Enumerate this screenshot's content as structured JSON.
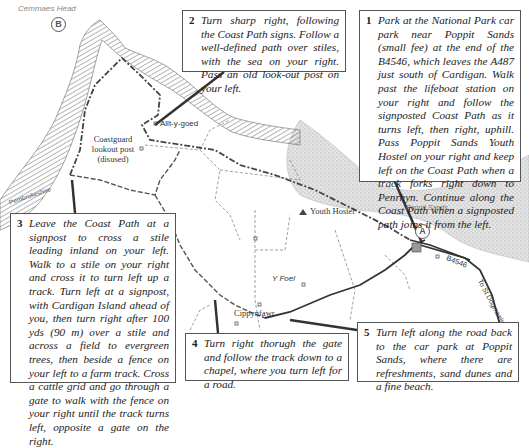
{
  "map": {
    "place_labels": {
      "cemmaes_head": "Cemmaes Head",
      "allt_y_goed": "Allt-y-goed",
      "coastguard": "Coastguard lookout post (disused)",
      "youth_hostel": "Youth Hostel",
      "y_foel": "Y Foel",
      "cippyn_fawr": "Cippynfawr",
      "poppit_sands": "Poppit Sands",
      "pembrokeshire": "Pembrokeshire",
      "road_number": "B4546",
      "to_st_dogmaels": "To St Dogmaels",
      "parking": "P"
    },
    "markers": {
      "start": "A",
      "end": "B"
    },
    "colors": {
      "path": "#444444",
      "pointer": "#333333",
      "sea_hatch": "#777777",
      "sand": "#cfcfcf"
    }
  },
  "steps": [
    {
      "number": "1",
      "text": "Park at the National Park car park near Poppit Sands (small fee) at the end of the B4546, which leaves the A487 just south of Cardigan. Walk past the lifeboat station on your right and follow the signposted Coast Path as it turns left, then right, uphill. Pass Poppit Sands Youth Hostel on your right and keep left on the Coast Path when a track forks right down to Penrhyn. Continue along the Coast Path when a signposted path joins it from the left."
    },
    {
      "number": "2",
      "text": "Turn sharp right, following the Coast Path signs. Follow a well-defined path over stiles, with the sea on your right. Pass an old look-out post on your left."
    },
    {
      "number": "3",
      "text": "Leave the Coast Path at a signpost to cross a stile leading inland on your left. Walk to a stile on your right and cross it to turn left up a track. Turn left at a signpost, with Cardigan Island ahead of you, then turn right after 100 yds (90 m) over a stile and across a field to evergreen trees, then beside a fence on your left to a farm track. Cross a cattle grid and go through a gate to walk with the fence on your right until the track turns left, opposite a gate on the right."
    },
    {
      "number": "4",
      "text": "Turn right thorugh the gate and follow the track down to a chapel, where you turn left for a road."
    },
    {
      "number": "5",
      "text": "Turn left along the road back to the car park at Poppit Sands, where there are refreshments, sand dunes and a fine beach."
    }
  ]
}
